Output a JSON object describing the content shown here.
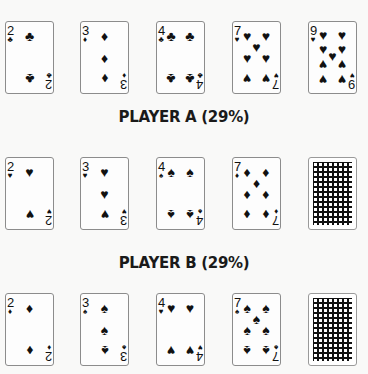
{
  "board": {
    "cards": [
      {
        "rank": "2",
        "suit": "♣",
        "suit_name": "clubs"
      },
      {
        "rank": "3",
        "suit": "♦",
        "suit_name": "diamonds"
      },
      {
        "rank": "4",
        "suit": "♣",
        "suit_name": "clubs"
      },
      {
        "rank": "7",
        "suit": "♥",
        "suit_name": "hearts"
      },
      {
        "rank": "9",
        "suit": "♥",
        "suit_name": "hearts"
      }
    ]
  },
  "player_a": {
    "label": "PLAYER A (29%)",
    "cards": [
      {
        "rank": "2",
        "suit": "♥",
        "suit_name": "hearts"
      },
      {
        "rank": "3",
        "suit": "♥",
        "suit_name": "hearts"
      },
      {
        "rank": "4",
        "suit": "♠",
        "suit_name": "spades"
      },
      {
        "rank": "7",
        "suit": "♦",
        "suit_name": "diamonds"
      },
      {
        "face_down": true
      }
    ]
  },
  "player_b": {
    "label": "PLAYER B (29%)",
    "cards": [
      {
        "rank": "2",
        "suit": "♦",
        "suit_name": "diamonds"
      },
      {
        "rank": "3",
        "suit": "♠",
        "suit_name": "spades"
      },
      {
        "rank": "4",
        "suit": "♥",
        "suit_name": "hearts"
      },
      {
        "rank": "7",
        "suit": "♠",
        "suit_name": "spades"
      },
      {
        "face_down": true
      }
    ]
  }
}
